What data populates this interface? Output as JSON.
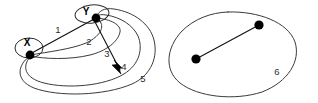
{
  "figure": {
    "background_color": "#ffffff",
    "stroke_color": "#3a3a3a",
    "node_color": "#000000",
    "label_color": "#2b2b2b",
    "width": 318,
    "height": 103
  },
  "left_graph": {
    "name": "multigraph-with-vertices-x-and-y",
    "nodes": [
      {
        "id": "x",
        "label": "X",
        "cx": 30,
        "cy": 55,
        "label_x": 27,
        "label_y": 46,
        "ring": true
      },
      {
        "id": "y",
        "label": "Y",
        "cx": 96,
        "cy": 18,
        "label_x": 86,
        "label_y": 15,
        "ring": true
      }
    ],
    "edges": [
      {
        "id": "e1",
        "label": "1",
        "label_x": 58,
        "label_y": 33
      },
      {
        "id": "e2",
        "label": "2",
        "label_x": 89,
        "label_y": 45
      },
      {
        "id": "e3",
        "label": "3",
        "label_x": 107,
        "label_y": 57
      },
      {
        "id": "e4",
        "label": "4",
        "label_x": 124,
        "label_y": 70,
        "arrow": true
      },
      {
        "id": "e5",
        "label": "5",
        "label_x": 143,
        "label_y": 82
      }
    ]
  },
  "right_graph": {
    "name": "region-with-two-vertices-and-one-edge",
    "region_label": "6",
    "region_label_x": 277,
    "region_label_y": 75,
    "nodes": [
      {
        "id": "p1",
        "cx": 196,
        "cy": 59
      },
      {
        "id": "p2",
        "cx": 259,
        "cy": 25
      }
    ],
    "edges": [
      {
        "id": "e6",
        "from": "p1",
        "to": "p2"
      }
    ]
  }
}
